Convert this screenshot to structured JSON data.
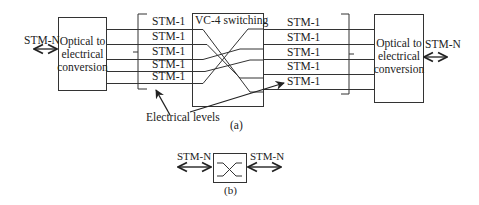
{
  "diagram_a": {
    "left_port_label": "STM-N",
    "left_box_lines": [
      "Optical to",
      "electrical",
      "conversion"
    ],
    "left_channels": [
      "STM-1",
      "STM-1",
      "STM-1",
      "STM-1",
      "STM-1"
    ],
    "switch_label": "VC-4 switching",
    "right_channels": [
      "STM-1",
      "STM-1",
      "STM-1",
      "STM-1",
      "STM-1"
    ],
    "right_box_lines": [
      "Optical to",
      "electrical",
      "conversion"
    ],
    "right_port_label": "STM-N",
    "annotation": "Electrical levels",
    "caption": "(a)"
  },
  "diagram_b": {
    "left_port_label": "STM-N",
    "right_port_label": "STM-N",
    "caption": "(b)"
  },
  "colors": {
    "stroke": "#333333",
    "text": "#222222"
  }
}
